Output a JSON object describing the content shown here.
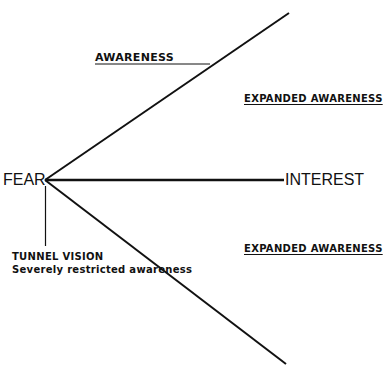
{
  "diagram": {
    "center_label": "FEAR",
    "branches": [
      {
        "id": "awareness",
        "label": "AWARENESS",
        "direction": "up-right"
      },
      {
        "id": "interest",
        "label": "INTEREST",
        "direction": "right"
      },
      {
        "id": "lower",
        "label": "",
        "direction": "down-right"
      }
    ],
    "region_labels": {
      "upper": "EXPANDED AWARENESS",
      "lower": "EXPANDED AWARENESS"
    },
    "tunnel_vision": {
      "title": "TUNNEL VISION",
      "subtitle": "Severely restricted awareness"
    },
    "colors": {
      "ink": "#111111",
      "background": "#ffffff"
    }
  }
}
